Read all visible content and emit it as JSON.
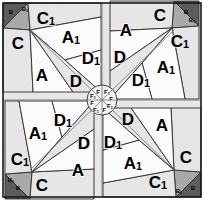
{
  "figure": {
    "width": 204,
    "height": 200,
    "symmetry": "4-fold rotational",
    "colors": {
      "background": "#ffffff",
      "piece_white": "#fbfbfb",
      "piece_light_gray": "#e6e6e6",
      "piece_gray": "#a9a9a9",
      "piece_dark_gray": "#5c5c5c",
      "outline": "#2b2b2b",
      "frame": "#1a1a1a",
      "label": "#000000"
    }
  },
  "labels": {
    "A": "A",
    "A1_base": "A",
    "A1_sub": "1",
    "B": "B",
    "B1_base": "B",
    "B1_sub": "1",
    "C": "C",
    "C1_base": "C",
    "C1_sub": "1",
    "D": "D",
    "D1_base": "D",
    "D1_sub": "1",
    "F": "F",
    "F1_base": "F",
    "F1_sub": "1"
  },
  "pieces": [
    {
      "id": "p-A-q1",
      "label": "A",
      "shade": "white"
    },
    {
      "id": "p-A1-q1",
      "label": "A1",
      "shade": "white"
    },
    {
      "id": "p-B-q1",
      "label": "B",
      "shade": "dark"
    },
    {
      "id": "p-B1-q1",
      "label": "B1",
      "shade": "gray"
    },
    {
      "id": "p-C-q1",
      "label": "C",
      "shade": "light"
    },
    {
      "id": "p-C1-q1",
      "label": "C1",
      "shade": "light"
    },
    {
      "id": "p-D-q1",
      "label": "D",
      "shade": "light"
    },
    {
      "id": "p-D1-q1",
      "label": "D1",
      "shade": "white"
    },
    {
      "id": "p-A-q2",
      "label": "A",
      "shade": "white"
    },
    {
      "id": "p-A1-q2",
      "label": "A1",
      "shade": "white"
    },
    {
      "id": "p-B-q2",
      "label": "B",
      "shade": "dark"
    },
    {
      "id": "p-B1-q2",
      "label": "B1",
      "shade": "gray"
    },
    {
      "id": "p-C-q2",
      "label": "C",
      "shade": "light"
    },
    {
      "id": "p-C1-q2",
      "label": "C1",
      "shade": "light"
    },
    {
      "id": "p-D-q2",
      "label": "D",
      "shade": "light"
    },
    {
      "id": "p-D1-q2",
      "label": "D1",
      "shade": "white"
    },
    {
      "id": "p-A-q3",
      "label": "A",
      "shade": "white"
    },
    {
      "id": "p-A1-q3",
      "label": "A1",
      "shade": "white"
    },
    {
      "id": "p-B-q3",
      "label": "B",
      "shade": "dark"
    },
    {
      "id": "p-B1-q3",
      "label": "B1",
      "shade": "gray"
    },
    {
      "id": "p-C-q3",
      "label": "C",
      "shade": "light"
    },
    {
      "id": "p-C1-q3",
      "label": "C1",
      "shade": "light"
    },
    {
      "id": "p-D-q3",
      "label": "D",
      "shade": "light"
    },
    {
      "id": "p-D1-q3",
      "label": "D1",
      "shade": "white"
    },
    {
      "id": "p-A-q4",
      "label": "A",
      "shade": "white"
    },
    {
      "id": "p-A1-q4",
      "label": "A1",
      "shade": "white"
    },
    {
      "id": "p-B-q4",
      "label": "B",
      "shade": "dark"
    },
    {
      "id": "p-B1-q4",
      "label": "B1",
      "shade": "gray"
    },
    {
      "id": "p-C-q4",
      "label": "C",
      "shade": "light"
    },
    {
      "id": "p-C1-q4",
      "label": "C1",
      "shade": "light"
    },
    {
      "id": "p-D-q4",
      "label": "D",
      "shade": "light"
    },
    {
      "id": "p-D1-q4",
      "label": "D1",
      "shade": "white"
    }
  ],
  "center": {
    "wedges": [
      "F",
      "F1",
      "F",
      "F1",
      "F",
      "F1",
      "F",
      "F1"
    ],
    "count": 8
  }
}
